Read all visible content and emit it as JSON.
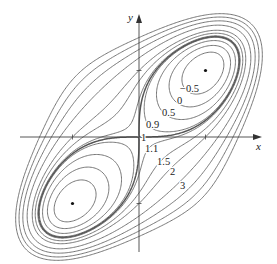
{
  "chart_data": {
    "type": "contour",
    "title": "",
    "function": "f(x,y) = x^4 + y^4 - 4xy + 1",
    "xlabel": "x",
    "ylabel": "y",
    "xlim": [
      -2.1,
      1.8
    ],
    "ylim": [
      -1.9,
      2.05
    ],
    "grid": false,
    "ticks": {
      "x": [
        -1,
        1
      ],
      "y": [
        -1,
        1
      ]
    },
    "levels": [
      -0.5,
      0,
      0.5,
      0.9,
      1,
      1.1,
      1.5,
      2,
      3,
      4,
      5,
      6
    ],
    "labeled_levels": [
      {
        "text": "−0.5",
        "px": 180,
        "py": 92
      },
      {
        "text": "0",
        "px": 177,
        "py": 104
      },
      {
        "text": "0.5",
        "px": 162,
        "py": 116
      },
      {
        "text": "0.9",
        "px": 146,
        "py": 128
      },
      {
        "text": "1",
        "px": 141,
        "py": 141
      },
      {
        "text": "1.1",
        "px": 145,
        "py": 152
      },
      {
        "text": "1.5",
        "px": 157,
        "py": 165
      },
      {
        "text": "2",
        "px": 170,
        "py": 175
      },
      {
        "text": "3",
        "px": 180,
        "py": 189
      }
    ],
    "critical_points": [
      {
        "x": 1,
        "y": 1,
        "type": "local minimum",
        "value": -1
      },
      {
        "x": -1,
        "y": -1,
        "type": "local minimum",
        "value": -1
      },
      {
        "x": 0,
        "y": 0,
        "type": "saddle",
        "value": 1
      }
    ],
    "pixel_mapping": {
      "origin_px": [
        139,
        137
      ],
      "unit_px": 66.5
    }
  }
}
